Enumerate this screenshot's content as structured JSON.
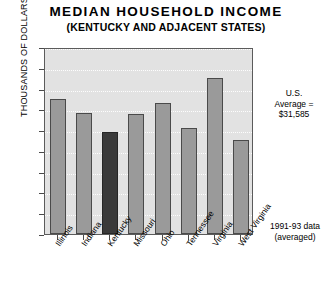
{
  "chart_data": {
    "type": "bar",
    "title": "MEDIAN  HOUSEHOLD  INCOME",
    "subtitle": "(KENTUCKY AND ADJACENT STATES)",
    "xlabel": "",
    "ylabel": "THOUSANDS OF DOLLARS",
    "categories": [
      "Illinois",
      "Indiana",
      "Kentucky",
      "Missouri",
      "Ohio",
      "Tennessee",
      "Virginia",
      "West Virginia"
    ],
    "values": [
      32.6,
      29.1,
      24.5,
      28.8,
      31.6,
      25.4,
      37.6,
      22.6
    ],
    "ylim": [
      0,
      45
    ],
    "yticks": [
      0,
      5,
      10,
      15,
      20,
      25,
      30,
      35,
      40,
      45
    ],
    "ytick_labels": [
      "0",
      "5",
      "10",
      "15",
      "20",
      "25",
      "30",
      "35",
      "40",
      "45"
    ],
    "grid": true,
    "legend": "none",
    "highlight_category": "Kentucky",
    "bar_color": "#9a9a9a",
    "highlight_color": "#3a3a3a",
    "plot_background": "#e2e2e2",
    "annotations": [
      {
        "name": "us-average",
        "lines": [
          "U.S.",
          "Average =",
          "$31,585"
        ],
        "text": "U.S. Average = $31,585",
        "value": 31.585
      },
      {
        "name": "data-source",
        "lines": [
          "1991-93 data",
          "(averaged)"
        ],
        "text": "1991-93 data (averaged)"
      }
    ]
  }
}
